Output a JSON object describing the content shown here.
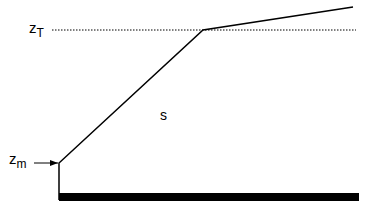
{
  "diagram": {
    "labels": {
      "top_level": {
        "main": "z",
        "sub": "T"
      },
      "bottom_level": {
        "main": "z",
        "sub": "m"
      },
      "region": "s"
    },
    "colors": {
      "stroke": "#000000",
      "background": "#ffffff"
    }
  }
}
